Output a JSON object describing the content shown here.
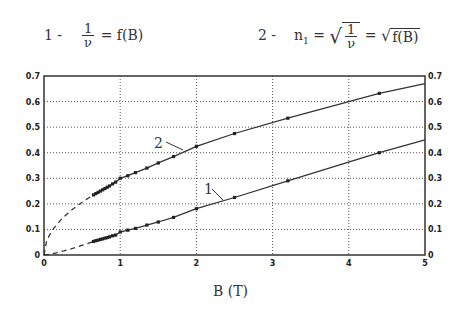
{
  "formulas": {
    "f1": {
      "prefix": "1 -",
      "num": "1",
      "den": "ν",
      "rhs": "= f(B)"
    },
    "f2": {
      "prefix": "2 -",
      "lhs": "n",
      "lhs_sub": "1",
      "eq": "=",
      "num": "1",
      "den": "ν",
      "rhs_eq": "=",
      "rhs_sqrt": "f(B)"
    }
  },
  "chart_data": {
    "type": "line",
    "title": "",
    "xlabel": "B (T)",
    "ylabel": "",
    "xlim": [
      0,
      5
    ],
    "ylim": [
      0,
      0.7
    ],
    "x_ticks": [
      "0",
      "1",
      "2",
      "3",
      "4",
      "5"
    ],
    "y_ticks_left": [
      "0",
      "0.1",
      "0.2",
      "0.3",
      "0.4",
      "0.5",
      "0.6",
      "0.7"
    ],
    "y_ticks_right": [
      "0",
      "0.1",
      "0.2",
      "0.3",
      "0.4",
      "0.5",
      "0.6",
      "0.7"
    ],
    "grid": true,
    "grid_style": "dotted",
    "legend": "inline formulas above chart",
    "series": [
      {
        "name": "1",
        "label": "1/ν = f(B)",
        "x": [
          0.65,
          0.68,
          0.71,
          0.74,
          0.77,
          0.8,
          0.83,
          0.86,
          0.9,
          0.94,
          1.0,
          1.1,
          1.2,
          1.35,
          1.5,
          1.7,
          2.0,
          2.5,
          3.2,
          4.4
        ],
        "values": [
          0.053,
          0.056,
          0.058,
          0.061,
          0.063,
          0.066,
          0.068,
          0.071,
          0.075,
          0.078,
          0.09,
          0.097,
          0.104,
          0.117,
          0.129,
          0.147,
          0.181,
          0.225,
          0.29,
          0.4
        ],
        "extrapolation": "dashed from 0 to 0.65",
        "line_end": {
          "x": 5,
          "y": 0.45
        }
      },
      {
        "name": "2",
        "label": "n_1 = √(1/ν) = √f(B)",
        "x": [
          0.65,
          0.68,
          0.71,
          0.74,
          0.77,
          0.8,
          0.83,
          0.86,
          0.9,
          0.94,
          1.0,
          1.1,
          1.2,
          1.35,
          1.5,
          1.7,
          2.0,
          2.5,
          3.2,
          4.4
        ],
        "values": [
          0.235,
          0.24,
          0.245,
          0.25,
          0.255,
          0.26,
          0.265,
          0.27,
          0.278,
          0.285,
          0.3,
          0.31,
          0.322,
          0.34,
          0.36,
          0.385,
          0.425,
          0.475,
          0.535,
          0.632
        ],
        "extrapolation": "dashed from 0 to 0.65",
        "line_end": {
          "x": 5,
          "y": 0.67
        }
      }
    ],
    "annotations": [
      {
        "text": "1",
        "series": "1"
      },
      {
        "text": "2",
        "series": "2"
      }
    ]
  }
}
